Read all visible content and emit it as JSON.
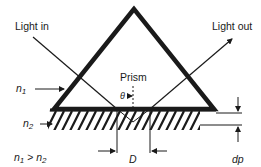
{
  "diagram": {
    "labels": {
      "light_in": "Light in",
      "light_out": "Light out",
      "prism": "Prism",
      "theta": "θ",
      "n1": "n",
      "n1_sub": "1",
      "n2": "n",
      "n2_sub": "2",
      "relation_n1": "n",
      "relation_n1_sub": "1",
      "relation_gt": " > ",
      "relation_n2": "n",
      "relation_n2_sub": "2",
      "D": "D",
      "dp": "dp"
    },
    "colors": {
      "ink": "#1a1a1a",
      "background": "#ffffff"
    }
  }
}
